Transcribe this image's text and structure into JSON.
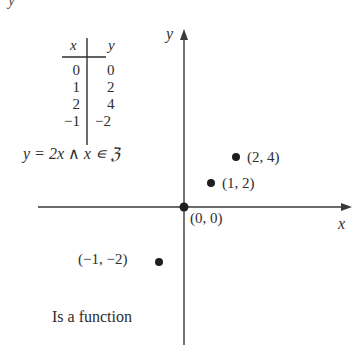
{
  "corner_label": "y",
  "table": {
    "headers": [
      "x",
      "y"
    ],
    "rows": [
      {
        "x": "0",
        "y": "0"
      },
      {
        "x": "1",
        "y": "2"
      },
      {
        "x": "2",
        "y": "4"
      },
      {
        "x": "−1",
        "y": "−2"
      }
    ]
  },
  "formula": "y = 2x ∧ x ∊ ℨ",
  "axes": {
    "x_label": "x",
    "y_label": "y"
  },
  "points": [
    {
      "label": "(0, 0)",
      "x": 0,
      "y": 0
    },
    {
      "label": "(1, 2)",
      "x": 1,
      "y": 2
    },
    {
      "label": "(2, 4)",
      "x": 2,
      "y": 4
    },
    {
      "label": "(−1, −2)",
      "x": -1,
      "y": -2
    }
  ],
  "conclusion": "Is a function",
  "colors": {
    "ink": "#2e2e2e",
    "background": "#ffffff"
  }
}
